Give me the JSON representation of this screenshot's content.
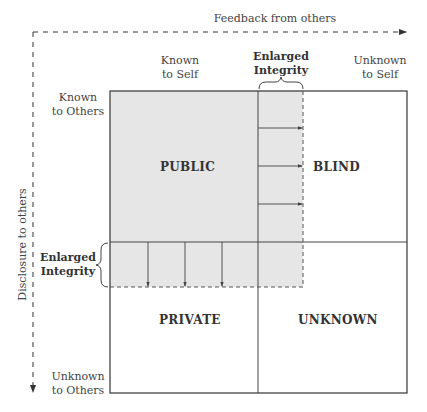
{
  "axes": {
    "horizontal_label": "Feedback from others",
    "vertical_label": "Disclosure to others"
  },
  "column_headers": {
    "left": [
      "Known",
      "to Self"
    ],
    "right": [
      "Unknown",
      "to Self"
    ]
  },
  "row_headers": {
    "top": [
      "Known",
      "to Others"
    ],
    "bottom": [
      "Unknown",
      "to Others"
    ]
  },
  "enlarged_labels": {
    "top": [
      "Enlarged",
      "Integrity"
    ],
    "left": [
      "Enlarged",
      "Integrity"
    ]
  },
  "quadrants": {
    "top_left": "PUBLIC",
    "top_right": "BLIND",
    "bottom_left": "PRIVATE",
    "bottom_right": "UNKNOWN"
  },
  "colors": {
    "shaded_area": "#e6e6e6",
    "lines": "#444444"
  }
}
